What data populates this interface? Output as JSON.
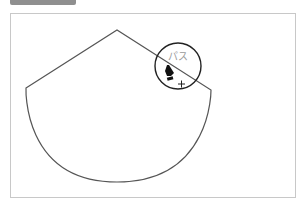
{
  "toolbar": {
    "tab_label": ""
  },
  "canvas": {
    "shape": "pie-segment-path",
    "stroke_color": "#555555",
    "cursor": {
      "tooltip": "パス",
      "tool": "pen-tool",
      "modifier": "+"
    },
    "magnifier_color": "#222222"
  }
}
